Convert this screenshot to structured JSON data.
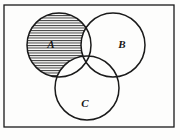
{
  "figure": {
    "type": "venn-diagram",
    "title": "",
    "background_color": "#fdfdfc",
    "stroke_color": "#1a1a1a",
    "hatch_color": "#222222"
  },
  "universe": {
    "shape": "rectangle",
    "label": "",
    "x": 4,
    "y": 5,
    "width": 170,
    "height": 122
  },
  "sets": [
    {
      "id": "A",
      "label": "A",
      "cx": 59,
      "cy": 45,
      "r": 32,
      "label_x": 51,
      "label_y": 48,
      "shaded": true,
      "shade_pattern": "horizontal-hatch"
    },
    {
      "id": "B",
      "label": "B",
      "cx": 113,
      "cy": 45,
      "r": 32,
      "label_x": 122,
      "label_y": 48,
      "shaded": false,
      "shade_pattern": "none"
    },
    {
      "id": "C",
      "label": "C",
      "cx": 87,
      "cy": 88,
      "r": 32,
      "label_x": 85,
      "label_y": 107,
      "shaded": false,
      "shade_pattern": "none"
    }
  ],
  "shading": {
    "region_expression": "A \\ (B ∪ C)",
    "pattern": "horizontal-hatch",
    "line_spacing_px": 2.5,
    "line_width_px": 0.9,
    "color": "#222222"
  }
}
